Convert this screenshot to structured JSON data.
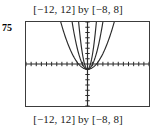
{
  "figure": {
    "problem_number": "75",
    "caption_top": "[−12, 12] by [−8, 8]",
    "caption_bottom": "[−12, 12] by [−8, 8]"
  },
  "chart_data": {
    "type": "line",
    "title": "[−12, 12] by [−8, 8]",
    "subtitle": "[−12, 12] by [−8, 8]",
    "xlabel": "",
    "ylabel": "",
    "xlim": [
      -12,
      12
    ],
    "ylim": [
      -8,
      8
    ],
    "xtick_step": 1,
    "ytick_step": 1,
    "grid": false,
    "legend": "none",
    "axis_color": "#2b2b2b",
    "curve_color": "#2b2b2b",
    "frame_color": "#3c3c3c",
    "vertex": [
      0,
      -1
    ],
    "series": [
      {
        "name": "y = 0.33x^2 - 1",
        "a": 0.33,
        "h": 0,
        "k": -1,
        "x": [
          -6.0,
          -5.0,
          -4.0,
          -3.0,
          -2.0,
          -1.0,
          0.0,
          1.0,
          2.0,
          3.0,
          4.0,
          5.0,
          6.0
        ],
        "values": [
          10.88,
          7.25,
          4.28,
          1.97,
          0.32,
          -0.67,
          -1.0,
          -0.67,
          0.32,
          1.97,
          4.28,
          7.25,
          10.88
        ]
      },
      {
        "name": "y = 1.0x^2 - 1",
        "a": 1.0,
        "h": 0,
        "k": -1,
        "x": [
          -3.5,
          -3.0,
          -2.5,
          -2.0,
          -1.5,
          -1.0,
          -0.5,
          0.0,
          0.5,
          1.0,
          1.5,
          2.0,
          2.5,
          3.0,
          3.5
        ],
        "values": [
          11.25,
          8.0,
          5.25,
          3.0,
          1.25,
          0.0,
          -0.75,
          -1.0,
          -0.75,
          0.0,
          1.25,
          3.0,
          5.25,
          8.0,
          11.25
        ]
      },
      {
        "name": "y = 3.0x^2 - 1",
        "a": 3.0,
        "h": 0,
        "k": -1,
        "x": [
          -2.0,
          -1.75,
          -1.5,
          -1.25,
          -1.0,
          -0.75,
          -0.5,
          -0.25,
          0.0,
          0.25,
          0.5,
          0.75,
          1.0,
          1.25,
          1.5,
          1.75,
          2.0
        ],
        "values": [
          11.0,
          8.19,
          5.75,
          3.69,
          2.0,
          0.69,
          -0.25,
          -0.81,
          -1.0,
          -0.81,
          -0.25,
          0.69,
          2.0,
          3.69,
          5.75,
          8.19,
          11.0
        ]
      }
    ]
  }
}
